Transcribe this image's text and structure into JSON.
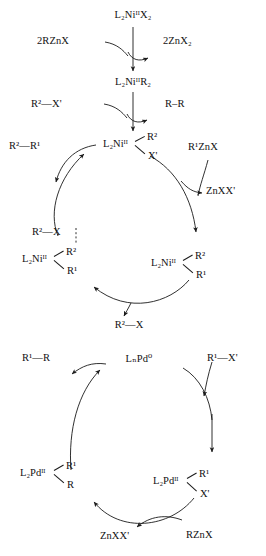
{
  "diagram": {
    "nickel_cycle": {
      "precatalyst": "L₂NiᴵᴵX₂",
      "transmetalation_reagent": "2RZnX",
      "transmetalation_byproduct": "2ZnX₂",
      "dialkyl_nickel": "L₂NiᴵᴵR₂",
      "oxidative_substrate": "R²—X'",
      "homocoupling_product": "R–R",
      "center_complex_core": "L₂Niᴵᴵ",
      "center_complex_up": "R²",
      "center_complex_down": "X'",
      "product_left": "R²—R¹",
      "reagent_right": "R¹ZnX",
      "byproduct_right": "ZnXX'",
      "left_complex_core": "L₂Niᴵᴵ",
      "left_complex_up": "R²",
      "left_complex_down": "R¹",
      "left_complex_incoming": "R²—X",
      "right_complex_core": "L₂Niᴵᴵ",
      "right_complex_up": "R²",
      "right_complex_down": "R¹",
      "bottom_substrate": "R²—X"
    },
    "palladium_cycle": {
      "center_catalyst": "LₙPd⁰",
      "product_left": "R¹—R",
      "substrate_right": "R¹—X'",
      "left_complex_core": "L₂Pdᴵᴵ",
      "left_complex_up": "R¹",
      "left_complex_down": "R",
      "right_complex_core": "L₂Pdᴵᴵ",
      "right_complex_up": "R¹",
      "right_complex_down": "X'",
      "byproduct_bottom": "ZnXX'",
      "reagent_bottom": "RZnX"
    }
  },
  "colors": {
    "ink": "#1a1a1a",
    "background": "#ffffff"
  }
}
